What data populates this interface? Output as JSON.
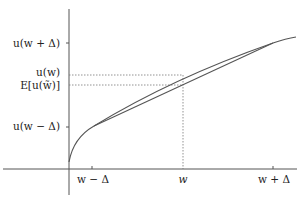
{
  "figure": {
    "type": "concave-utility-jensen-diagram",
    "y_labels": {
      "u_w_plus": "u(w + Δ)",
      "u_w": "u(w)",
      "expected": "E[u(w̃)]",
      "u_w_minus": "u(w − Δ)"
    },
    "x_labels": {
      "w_minus": "w − Δ",
      "w": "w",
      "w_plus": "w + Δ"
    },
    "elements": [
      "concave utility curve u(w)",
      "chord between (w−Δ, u(w−Δ)) and (w+Δ, u(w+Δ))",
      "dotted guide lines at w, u(w), E[u(w̃)]"
    ],
    "colors": {
      "axis": "#555555",
      "curve": "#555555",
      "guide": "#777777"
    }
  }
}
